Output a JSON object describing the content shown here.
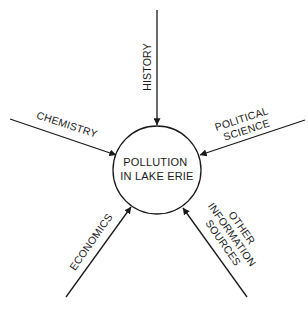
{
  "diagram": {
    "type": "hub-and-spoke",
    "colors": {
      "ink": "#1a1a1a",
      "background": "#ffffff"
    },
    "center": {
      "label_lines": [
        "POLLUTION",
        "IN LAKE ERIE"
      ]
    },
    "spokes": [
      {
        "id": "history",
        "label_lines": [
          "HISTORY"
        ]
      },
      {
        "id": "chemistry",
        "label_lines": [
          "CHEMISTRY"
        ]
      },
      {
        "id": "political-science",
        "label_lines": [
          "POLITICAL",
          "SCIENCE"
        ]
      },
      {
        "id": "economics",
        "label_lines": [
          "ECONOMICS"
        ]
      },
      {
        "id": "other-information-sources",
        "label_lines": [
          "OTHER",
          "INFORMATION",
          "SOURCES"
        ]
      }
    ]
  }
}
